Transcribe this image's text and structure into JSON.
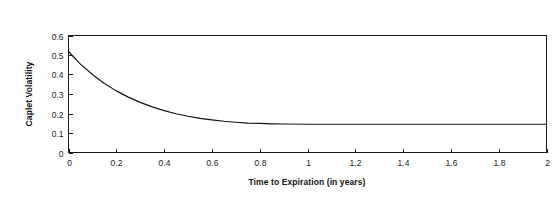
{
  "chart_data": {
    "type": "line",
    "title": "Sample Caplet Volatility Term Structure",
    "xlabel": "Time to Expiration (in years)",
    "ylabel": "Caplet Volatility",
    "xlim": [
      0,
      2
    ],
    "ylim": [
      0,
      0.6
    ],
    "grid": false,
    "legend": null,
    "legend_position": "none",
    "x_ticks": [
      "0",
      "0.2",
      "0.4",
      "0.6",
      "0.8",
      "1",
      "1.2",
      "1.4",
      "1.6",
      "1.8",
      "2"
    ],
    "x_tick_values": [
      0,
      0.2,
      0.4,
      0.6,
      0.8,
      1.0,
      1.2,
      1.4,
      1.6,
      1.8,
      2.0
    ],
    "y_ticks": [
      "0",
      "0.1",
      "0.2",
      "0.3",
      "0.4",
      "0.5",
      "0.6"
    ],
    "y_tick_values": [
      0,
      0.1,
      0.2,
      0.3,
      0.4,
      0.5,
      0.6
    ],
    "series": [
      {
        "name": "Caplet Volatility",
        "color": "#121212",
        "x": [
          0.0,
          0.05,
          0.1,
          0.15,
          0.2,
          0.25,
          0.3,
          0.35,
          0.4,
          0.45,
          0.5,
          0.55,
          0.6,
          0.65,
          0.7,
          0.75,
          0.8,
          0.85,
          0.9,
          1.0,
          1.1,
          1.2,
          1.3,
          1.4,
          1.5,
          1.6,
          1.7,
          1.8,
          1.9,
          2.0
        ],
        "values": [
          0.518,
          0.453,
          0.4,
          0.354,
          0.316,
          0.284,
          0.257,
          0.234,
          0.215,
          0.199,
          0.186,
          0.175,
          0.167,
          0.16,
          0.155,
          0.151,
          0.149,
          0.147,
          0.146,
          0.145,
          0.145,
          0.145,
          0.145,
          0.145,
          0.145,
          0.145,
          0.145,
          0.145,
          0.145,
          0.145
        ]
      }
    ]
  }
}
